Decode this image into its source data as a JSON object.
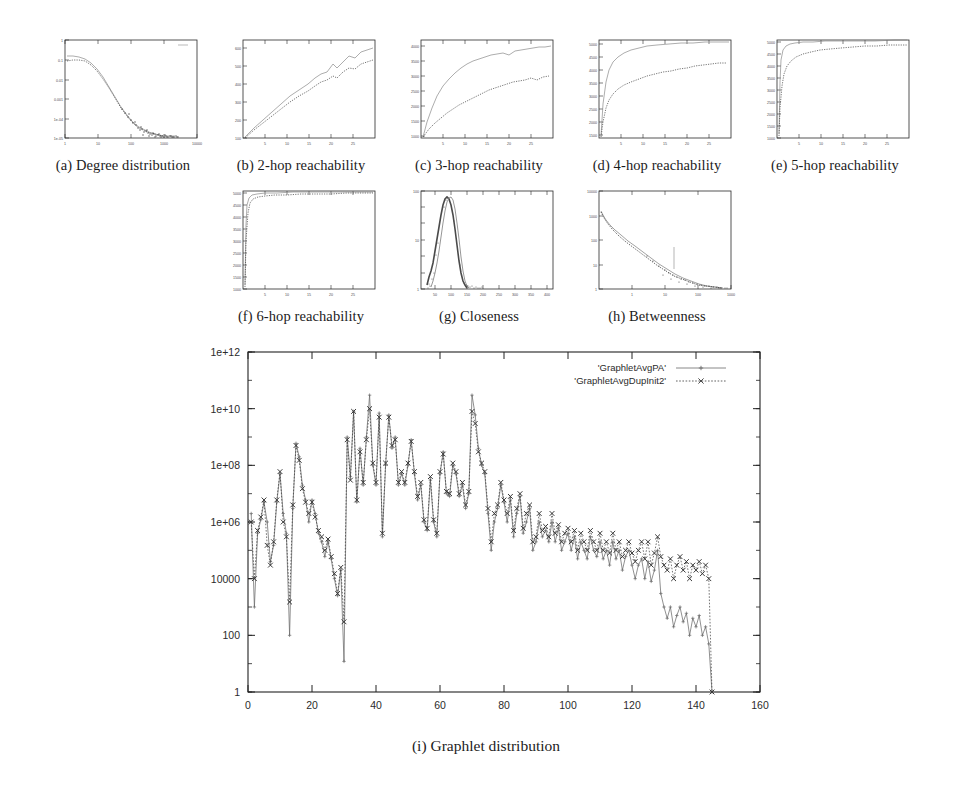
{
  "figure": {
    "caption_main": "(i) Graphlet distribution"
  },
  "panels": [
    {
      "id": "a",
      "caption": "(a)  Degree distribution",
      "kind": "degree"
    },
    {
      "id": "b",
      "caption": "(b)  2-hop reachability",
      "kind": "linear-rise"
    },
    {
      "id": "c",
      "caption": "(c)  3-hop reachability",
      "kind": "concave-split"
    },
    {
      "id": "d",
      "caption": "(d)  4-hop reachability",
      "kind": "saturate-split"
    },
    {
      "id": "e",
      "caption": "(e)  5-hop reachability",
      "kind": "saturate-fast"
    },
    {
      "id": "f",
      "caption": "(f)  6-hop reachability",
      "kind": "saturate-sharp"
    },
    {
      "id": "g",
      "caption": "(g)  Closeness",
      "kind": "peak"
    },
    {
      "id": "h",
      "caption": "(h)  Betweenness",
      "kind": "decay"
    }
  ],
  "legend": {
    "entries": [
      {
        "label": "'GraphletAvgPA'",
        "marker": "plus-marker",
        "color": "#6b6b6b"
      },
      {
        "label": "'GraphletAvgDupInit2'",
        "marker": "cross-marker",
        "color": "#3a3a3a"
      }
    ]
  },
  "chart_data": {
    "type": "line",
    "title": "(i) Graphlet distribution",
    "xlabel": "",
    "ylabel": "",
    "xlim": [
      0,
      160
    ],
    "ylim": [
      1,
      1000000000000
    ],
    "yscale": "log",
    "grid": false,
    "legend_position": "top-right",
    "xticks": [
      0,
      20,
      40,
      60,
      80,
      100,
      120,
      140,
      160
    ],
    "yticks": [
      1,
      100,
      10000,
      1000000,
      100000000,
      10000000000,
      1000000000000
    ],
    "yticklabels": [
      "1",
      "100",
      "10000",
      "1e+06",
      "1e+08",
      "1e+10",
      "1e+12"
    ],
    "x": [
      1,
      2,
      3,
      4,
      5,
      6,
      7,
      8,
      9,
      10,
      11,
      12,
      13,
      14,
      15,
      16,
      17,
      18,
      19,
      20,
      21,
      22,
      23,
      24,
      25,
      26,
      27,
      28,
      29,
      30,
      31,
      32,
      33,
      34,
      35,
      36,
      37,
      38,
      39,
      40,
      41,
      42,
      43,
      44,
      45,
      46,
      47,
      48,
      49,
      50,
      51,
      52,
      53,
      54,
      55,
      56,
      57,
      58,
      59,
      60,
      61,
      62,
      63,
      64,
      65,
      66,
      67,
      68,
      69,
      70,
      71,
      72,
      73,
      74,
      75,
      76,
      77,
      78,
      79,
      80,
      81,
      82,
      83,
      84,
      85,
      86,
      87,
      88,
      89,
      90,
      91,
      92,
      93,
      94,
      95,
      96,
      97,
      98,
      99,
      100,
      101,
      102,
      103,
      104,
      105,
      106,
      107,
      108,
      109,
      110,
      111,
      112,
      113,
      114,
      115,
      116,
      117,
      118,
      119,
      120,
      121,
      122,
      123,
      124,
      125,
      126,
      127,
      128,
      129,
      130,
      131,
      132,
      133,
      134,
      135,
      136,
      137,
      138,
      139,
      140,
      141,
      142,
      143,
      144,
      145
    ],
    "series": [
      {
        "name": "'GraphletAvgPA'",
        "marker": "+",
        "color": "#6b6b6b",
        "values": [
          2000000.0,
          1000.0,
          400000.0,
          1200000.0,
          5000000.0,
          1000000.0,
          40000.0,
          150000.0,
          5000000.0,
          50000000.0,
          2000000.0,
          400000.0,
          100.0,
          3000000.0,
          600000000.0,
          200000000.0,
          20000000.0,
          6000000.0,
          1000000.0,
          6000000.0,
          2000000.0,
          400000.0,
          200000.0,
          60000.0,
          200000.0,
          50000.0,
          10000.0,
          2500.0,
          20000.0,
          12.0,
          1000000000.0,
          40000000.0,
          8000000000.0,
          5000000.0,
          400000000.0,
          20000000.0,
          1000000000.0,
          30000000000.0,
          100000000.0,
          20000000.0,
          7000000000.0,
          300000.0,
          100000000.0,
          6000000000.0,
          400000000.0,
          1000000000.0,
          20000000.0,
          50000000.0,
          20000000.0,
          100000000.0,
          800000000.0,
          50000000.0,
          6000000.0,
          20000000.0,
          1000000.0,
          500000.0,
          30000000.0,
          1000000.0,
          300000.0,
          50000000.0,
          300000000.0,
          10000000.0,
          8000000.0,
          100000000.0,
          50000000.0,
          8000000.0,
          20000000.0,
          3000000.0,
          10000000.0,
          30000000000.0,
          6000000000.0,
          400000000.0,
          100000000.0,
          50000000.0,
          2000000.0,
          100000.0,
          1000000.0,
          3000000.0,
          20000000.0,
          5000000.0,
          1000000.0,
          6000000.0,
          300000.0,
          2000000.0,
          8000000.0,
          400000.0,
          1000000.0,
          3000000.0,
          100000.0,
          200000.0,
          1000000.0,
          300000.0,
          500000.0,
          200000.0,
          1000000.0,
          200000.0,
          600000.0,
          100000.0,
          200000.0,
          400000.0,
          100000.0,
          300000.0,
          50000.0,
          200000.0,
          100000.0,
          50000.0,
          300000.0,
          100000.0,
          60000.0,
          200000.0,
          50000.0,
          100000.0,
          30000.0,
          200000.0,
          50000.0,
          100000.0,
          20000.0,
          60000.0,
          100000.0,
          30000.0,
          10000.0,
          30000.0,
          50000.0,
          10000.0,
          40000.0,
          8000.0,
          20000.0,
          100000.0,
          3000.0,
          1000.0,
          400.0,
          1000.0,
          200.0,
          500.0,
          1000.0,
          300.0,
          600.0,
          100.0,
          400.0,
          200.0,
          500.0,
          100.0,
          200.0,
          50.0,
          1.0
        ]
      },
      {
        "name": "'GraphletAvgDupInit2'",
        "marker": "x",
        "color": "#3a3a3a",
        "values": [
          1000000.0,
          10000.0,
          500000.0,
          1500000.0,
          6000000.0,
          150000.0,
          30000.0,
          200000.0,
          6000000.0,
          60000000.0,
          1000000.0,
          300000.0,
          1500.0,
          4000000.0,
          500000000.0,
          150000000.0,
          15000000.0,
          5000000.0,
          2000000.0,
          5000000.0,
          1500000.0,
          500000.0,
          300000.0,
          100000.0,
          250000.0,
          60000.0,
          15000.0,
          3000.0,
          25000.0,
          300.0,
          800000000.0,
          30000000.0,
          8000000000.0,
          6000000.0,
          300000000.0,
          25000000.0,
          800000000.0,
          10000000000.0,
          120000000.0,
          25000000.0,
          5000000000.0,
          400000.0,
          120000000.0,
          5000000000.0,
          500000000.0,
          800000000.0,
          25000000.0,
          60000000.0,
          25000000.0,
          120000000.0,
          700000000.0,
          60000000.0,
          8000000.0,
          25000000.0,
          1200000.0,
          600000.0,
          40000000.0,
          1200000.0,
          400000.0,
          60000000.0,
          250000000.0,
          12000000.0,
          10000000.0,
          120000000.0,
          60000000.0,
          10000000.0,
          25000000.0,
          4000000.0,
          12000000.0,
          8000000000.0,
          3000000000.0,
          300000000.0,
          120000000.0,
          60000000.0,
          3000000.0,
          200000.0,
          2000000.0,
          4000000.0,
          25000000.0,
          6000000.0,
          2000000.0,
          8000000.0,
          500000.0,
          3000000.0,
          10000000.0,
          600000.0,
          2000000.0,
          4000000.0,
          200000.0,
          300000.0,
          2000000.0,
          500000.0,
          700000.0,
          300000.0,
          2000000.0,
          400000.0,
          800000.0,
          200000.0,
          400000.0,
          600000.0,
          200000.0,
          500000.0,
          100000.0,
          400000.0,
          200000.0,
          100000.0,
          500000.0,
          200000.0,
          100000.0,
          400000.0,
          100000.0,
          200000.0,
          80000.0,
          400000.0,
          100000.0,
          200000.0,
          60000.0,
          100000.0,
          200000.0,
          80000.0,
          40000.0,
          100000.0,
          200000.0,
          50000.0,
          200000.0,
          30000.0,
          80000.0,
          300000.0,
          60000.0,
          30000.0,
          20000.0,
          50000.0,
          10000.0,
          30000.0,
          60000.0,
          20000.0,
          40000.0,
          10000.0,
          30000.0,
          20000.0,
          40000.0,
          15000.0,
          30000.0,
          10000.0,
          1.0
        ]
      }
    ]
  }
}
